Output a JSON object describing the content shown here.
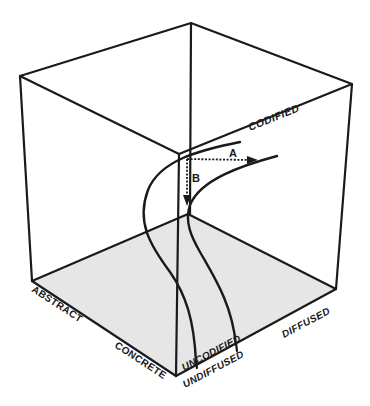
{
  "diagram": {
    "type": "3d-cube",
    "floor_color": "#e6e6e6",
    "line_color": "#1a1a1a",
    "axes": {
      "vertical": {
        "label_high": "CODIFIED",
        "label_low": "UNCODIFIED"
      },
      "left_depth": {
        "label_far": "ABSTRACT",
        "label_near": "CONCRETE"
      },
      "right_depth": {
        "label_near": "UNDIFFUSED",
        "label_far": "DIFFUSED"
      }
    },
    "arrows": [
      {
        "id": "A",
        "label": "A",
        "direction": "horizontal toward diffused"
      },
      {
        "id": "B",
        "label": "B",
        "direction": "downward toward uncodified"
      }
    ],
    "curves": [
      {
        "id": "curve-left",
        "description": "S-curve from codified region down to concrete/undiffused"
      },
      {
        "id": "curve-right",
        "description": "curve from codified/diffused toward uncodified/undiffused"
      }
    ]
  }
}
